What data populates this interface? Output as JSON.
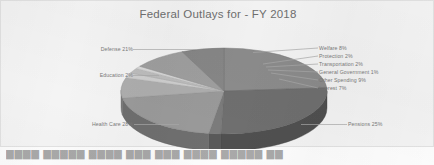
{
  "chart_data": {
    "type": "pie",
    "title": "Federal Outlays for - FY 2018",
    "xlabel": "",
    "ylabel": "",
    "legend_position": "none",
    "grid": false,
    "three_d": true,
    "categories": [
      "Pensions",
      "Health Care",
      "Education",
      "Defense",
      "Welfare",
      "Protection",
      "Transportation",
      "General Government",
      "Other Spending",
      "Interest"
    ],
    "values": [
      25,
      28,
      2,
      21,
      8,
      2,
      2,
      1,
      9,
      7
    ],
    "value_unit": "%",
    "slices": [
      {
        "label": "Pensions 25%",
        "name": "Pensions",
        "value": 25,
        "color": "#8c8c8c"
      },
      {
        "label": "Health Care 28%",
        "name": "Health Care",
        "value": 28,
        "color": "#6f6f6f"
      },
      {
        "label": "Education 2%",
        "name": "Education",
        "value": 2,
        "color": "#7b7b7b"
      },
      {
        "label": "Defense 21%",
        "name": "Defense",
        "value": 21,
        "color": "#9a9a9a"
      },
      {
        "label": "Welfare 8%",
        "name": "Welfare",
        "value": 8,
        "color": "#aeaeae"
      },
      {
        "label": "Protection 2%",
        "name": "Protection",
        "value": 2,
        "color": "#cfcfcf"
      },
      {
        "label": "Transportation 2%",
        "name": "Transportation",
        "value": 2,
        "color": "#bdbdbd"
      },
      {
        "label": "General Government 1%",
        "name": "General Government",
        "value": 1,
        "color": "#d8d8d8"
      },
      {
        "label": "Other Spending 9%",
        "name": "Other Spending",
        "value": 9,
        "color": "#9f9f9f"
      },
      {
        "label": "Interest 7%",
        "name": "Interest",
        "value": 7,
        "color": "#878787"
      }
    ]
  },
  "labels": {
    "defense": "Defense 21%",
    "education": "Education 2%",
    "health_care": "Health Care 28%",
    "pensions": "Pensions 25%",
    "welfare": "Welfare 8%",
    "protection": "Protection 2%",
    "transportation": "Transportation 2%",
    "general_government": "General Government 1%",
    "other_spending": "Other Spending 9%",
    "interest": "Interest 7%"
  },
  "colors": {
    "background": "#f4f4f4",
    "page": "#fdfdfd",
    "title_text": "#6f6f6f",
    "label_text": "#7a7a7a",
    "leader_line": "#a9a9a9"
  },
  "bottom_strip": {
    "text": "████ █████ ████  ███   ███    ████       █████         ██"
  }
}
